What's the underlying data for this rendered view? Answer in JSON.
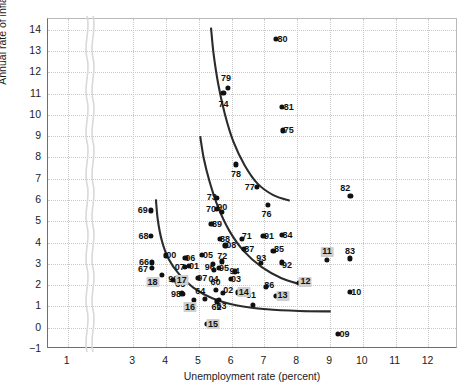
{
  "chart_data": {
    "type": "scatter",
    "title": "",
    "xlabel": "Unemployment rate (percent)",
    "ylabel": "Annual rate of inflation (percent)",
    "xlim": [
      0.4,
      12.9
    ],
    "ylim": [
      -1,
      14.5
    ],
    "xticks": [
      1,
      3,
      4,
      5,
      6,
      7,
      8,
      9,
      10,
      11,
      12
    ],
    "yticks": [
      -1,
      0,
      1,
      2,
      3,
      4,
      5,
      6,
      7,
      8,
      9,
      10,
      11,
      12,
      13,
      14
    ],
    "grid": true,
    "legend": "none",
    "axis_break": {
      "between": [
        1,
        3
      ],
      "axis": "x"
    },
    "points": [
      {
        "label": "60",
        "x": 5.54,
        "y": 1.72,
        "lx": 5.54,
        "ly": 2.12
      },
      {
        "label": "61",
        "x": 6.69,
        "y": 1.02,
        "lx": 6.62,
        "ly": 1.47
      },
      {
        "label": "62",
        "x": 5.57,
        "y": 1.19,
        "lx": 5.57,
        "ly": 0.92
      },
      {
        "label": "63",
        "x": 5.64,
        "y": 1.24,
        "lx": 5.72,
        "ly": 0.96
      },
      {
        "label": "64",
        "x": 5.21,
        "y": 1.31,
        "lx": 5.07,
        "ly": 1.66
      },
      {
        "label": "65",
        "x": 4.51,
        "y": 1.59,
        "lx": 4.46,
        "ly": 2.0
      },
      {
        "label": "66",
        "x": 3.6,
        "y": 3.02,
        "lx": 3.36,
        "ly": 3.02
      },
      {
        "label": "67",
        "x": 3.6,
        "y": 2.77,
        "lx": 3.33,
        "ly": 2.72
      },
      {
        "label": "68",
        "x": 3.58,
        "y": 4.27,
        "lx": 3.34,
        "ly": 4.27
      },
      {
        "label": "69",
        "x": 3.56,
        "y": 5.46,
        "lx": 3.32,
        "ly": 5.46
      },
      {
        "label": "70",
        "x": 5.58,
        "y": 5.52,
        "lx": 5.4,
        "ly": 5.52
      },
      {
        "label": "71",
        "x": 6.34,
        "y": 4.14,
        "lx": 6.49,
        "ly": 4.26
      },
      {
        "label": "72",
        "x": 5.74,
        "y": 3.07,
        "lx": 5.74,
        "ly": 3.3
      },
      {
        "label": "73",
        "x": 5.59,
        "y": 6.06,
        "lx": 5.42,
        "ly": 6.11
      },
      {
        "label": "74",
        "x": 5.78,
        "y": 10.98,
        "lx": 5.78,
        "ly": 10.44
      },
      {
        "label": "75",
        "x": 7.59,
        "y": 9.22,
        "lx": 7.77,
        "ly": 9.22
      },
      {
        "label": "76",
        "x": 7.13,
        "y": 5.74,
        "lx": 7.09,
        "ly": 5.3
      },
      {
        "label": "77",
        "x": 6.79,
        "y": 6.56,
        "lx": 6.58,
        "ly": 6.56
      },
      {
        "label": "78",
        "x": 6.16,
        "y": 7.62,
        "lx": 6.16,
        "ly": 7.15
      },
      {
        "label": "79",
        "x": 5.92,
        "y": 11.22,
        "lx": 5.86,
        "ly": 11.68
      },
      {
        "label": "80",
        "x": 7.37,
        "y": 13.5,
        "lx": 7.58,
        "ly": 13.5
      },
      {
        "label": "81",
        "x": 7.57,
        "y": 10.32,
        "lx": 7.77,
        "ly": 10.32
      },
      {
        "label": "82",
        "x": 9.65,
        "y": 6.16,
        "lx": 9.49,
        "ly": 6.5
      },
      {
        "label": "83",
        "x": 9.64,
        "y": 3.21,
        "lx": 9.64,
        "ly": 3.56
      },
      {
        "label": "84",
        "x": 7.55,
        "y": 4.32,
        "lx": 7.73,
        "ly": 4.32
      },
      {
        "label": "85",
        "x": 7.3,
        "y": 3.56,
        "lx": 7.47,
        "ly": 3.64
      },
      {
        "label": "86",
        "x": 7.07,
        "y": 1.86,
        "lx": 7.18,
        "ly": 1.95
      },
      {
        "label": "87",
        "x": 6.4,
        "y": 3.65,
        "lx": 6.57,
        "ly": 3.65
      },
      {
        "label": "88",
        "x": 5.67,
        "y": 4.14,
        "lx": 5.83,
        "ly": 4.14
      },
      {
        "label": "89",
        "x": 5.41,
        "y": 4.82,
        "lx": 5.58,
        "ly": 4.82
      },
      {
        "label": "90",
        "x": 5.74,
        "y": 5.4,
        "lx": 5.74,
        "ly": 5.64
      },
      {
        "label": "91",
        "x": 7.0,
        "y": 4.26,
        "lx": 7.17,
        "ly": 4.26
      },
      {
        "label": "92",
        "x": 7.55,
        "y": 3.02,
        "lx": 7.72,
        "ly": 2.92
      },
      {
        "label": "93",
        "x": 6.93,
        "y": 2.98,
        "lx": 6.93,
        "ly": 3.24
      },
      {
        "label": "94",
        "x": 6.12,
        "y": 2.6,
        "lx": 6.12,
        "ly": 2.6
      },
      {
        "label": "95",
        "x": 5.64,
        "y": 2.78,
        "lx": 5.8,
        "ly": 2.74
      },
      {
        "label": "96",
        "x": 5.45,
        "y": 2.94,
        "lx": 5.36,
        "ly": 2.8
      },
      {
        "label": "97",
        "x": 5.0,
        "y": 2.29,
        "lx": 5.13,
        "ly": 2.29
      },
      {
        "label": "98",
        "x": 4.53,
        "y": 1.54,
        "lx": 4.33,
        "ly": 1.54
      },
      {
        "label": "99",
        "x": 4.25,
        "y": 2.19,
        "lx": 4.25,
        "ly": 2.25
      },
      {
        "label": "00",
        "x": 4.02,
        "y": 3.35,
        "lx": 4.19,
        "ly": 3.35
      },
      {
        "label": "01",
        "x": 4.73,
        "y": 2.84,
        "lx": 4.88,
        "ly": 2.84
      },
      {
        "label": "02",
        "x": 5.77,
        "y": 1.6,
        "lx": 5.93,
        "ly": 1.72
      },
      {
        "label": "03",
        "x": 6.0,
        "y": 2.26,
        "lx": 6.16,
        "ly": 2.26
      },
      {
        "label": "04",
        "x": 5.48,
        "y": 2.67,
        "lx": 5.48,
        "ly": 2.26
      },
      {
        "label": "05",
        "x": 5.12,
        "y": 3.38,
        "lx": 5.31,
        "ly": 3.38
      },
      {
        "label": "06",
        "x": 4.62,
        "y": 3.22,
        "lx": 4.77,
        "ly": 3.22
      },
      {
        "label": "07",
        "x": 4.6,
        "y": 2.8,
        "lx": 4.45,
        "ly": 2.8
      },
      {
        "label": "08",
        "x": 5.84,
        "y": 3.82,
        "lx": 6.02,
        "ly": 3.82
      },
      {
        "label": "09",
        "x": 9.26,
        "y": -0.34,
        "lx": 9.47,
        "ly": -0.34
      },
      {
        "label": "10",
        "x": 9.63,
        "y": 1.63,
        "lx": 9.83,
        "ly": 1.63
      },
      {
        "label": "11",
        "x": 8.94,
        "y": 3.14,
        "lx": 8.94,
        "ly": 3.52,
        "highlight": true
      },
      {
        "label": "12",
        "x": 8.08,
        "y": 2.06,
        "lx": 8.28,
        "ly": 2.12,
        "highlight": true
      },
      {
        "label": "13",
        "x": 7.37,
        "y": 1.46,
        "lx": 7.58,
        "ly": 1.46,
        "highlight": true
      },
      {
        "label": "14",
        "x": 6.21,
        "y": 1.61,
        "lx": 6.4,
        "ly": 1.61,
        "highlight": true
      },
      {
        "label": "15",
        "x": 5.28,
        "y": 0.12,
        "lx": 5.46,
        "ly": 0.12,
        "highlight": true
      },
      {
        "label": "16",
        "x": 4.87,
        "y": 1.26,
        "lx": 4.76,
        "ly": 0.92,
        "highlight": true
      },
      {
        "label": "17",
        "x": 4.36,
        "y": 2.13,
        "lx": 4.51,
        "ly": 2.18,
        "highlight": true
      },
      {
        "label": "18",
        "x": 3.9,
        "y": 2.44,
        "lx": 3.62,
        "ly": 2.08,
        "highlight": true
      }
    ],
    "curves": [
      {
        "name": "phillips-curve-1970s",
        "points": [
          [
            5.4,
            14.05
          ],
          [
            5.48,
            12.8
          ],
          [
            5.62,
            11.4
          ],
          [
            5.82,
            10.0
          ],
          [
            6.08,
            8.7
          ],
          [
            6.42,
            7.6
          ],
          [
            6.82,
            6.72
          ],
          [
            7.3,
            6.18
          ],
          [
            7.8,
            5.92
          ]
        ]
      },
      {
        "name": "phillips-curve-1980s",
        "points": [
          [
            5.07,
            8.95
          ],
          [
            5.18,
            7.9
          ],
          [
            5.36,
            6.8
          ],
          [
            5.62,
            5.6
          ],
          [
            5.96,
            4.5
          ],
          [
            6.4,
            3.55
          ],
          [
            6.95,
            2.8
          ],
          [
            7.55,
            2.28
          ],
          [
            8.1,
            2.0
          ]
        ]
      },
      {
        "name": "phillips-curve-2000s",
        "points": [
          [
            3.72,
            5.98
          ],
          [
            3.78,
            5.0
          ],
          [
            3.9,
            4.05
          ],
          [
            4.1,
            3.2
          ],
          [
            4.42,
            2.48
          ],
          [
            4.86,
            1.84
          ],
          [
            5.44,
            1.34
          ],
          [
            6.2,
            1.0
          ],
          [
            7.1,
            0.82
          ],
          [
            8.1,
            0.74
          ],
          [
            9.05,
            0.72
          ]
        ]
      }
    ]
  }
}
